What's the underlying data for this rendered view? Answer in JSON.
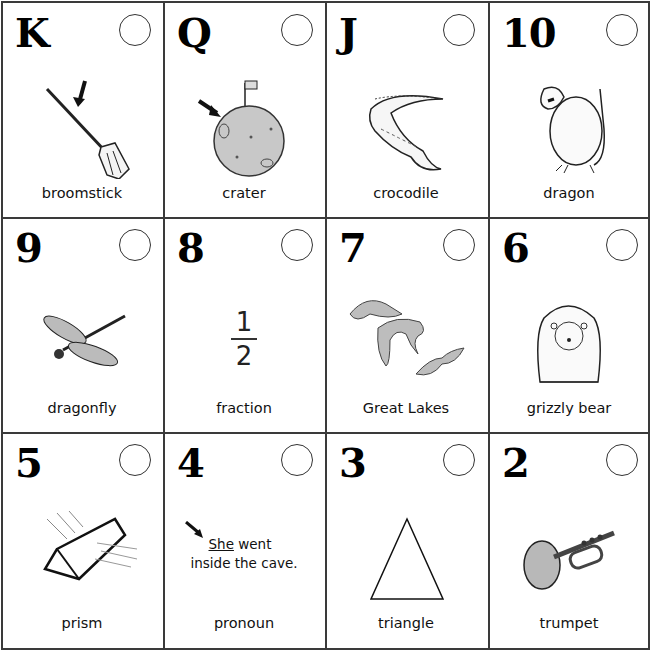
{
  "cards": [
    {
      "code": "K",
      "word": "broomstick",
      "picture": "broomstick-icon",
      "answer": ""
    },
    {
      "code": "Q",
      "word": "crater",
      "picture": "moon-crater-icon",
      "answer": ""
    },
    {
      "code": "J",
      "word": "crocodile",
      "picture": "crocodile-icon",
      "answer": ""
    },
    {
      "code": "10",
      "word": "dragon",
      "picture": "dragon-icon",
      "answer": ""
    },
    {
      "code": "9",
      "word": "dragonfly",
      "picture": "dragonfly-icon",
      "answer": ""
    },
    {
      "code": "8",
      "word": "fraction",
      "picture": "fraction",
      "answer": ""
    },
    {
      "code": "7",
      "word": "Great Lakes",
      "picture": "great-lakes-map-icon",
      "answer": ""
    },
    {
      "code": "6",
      "word": "grizzly bear",
      "picture": "grizzly-bear-icon",
      "answer": ""
    },
    {
      "code": "5",
      "word": "prism",
      "picture": "prism-icon",
      "answer": ""
    },
    {
      "code": "4",
      "word": "pronoun",
      "picture": "sentence",
      "answer": ""
    },
    {
      "code": "3",
      "word": "triangle",
      "picture": "triangle-icon",
      "answer": ""
    },
    {
      "code": "2",
      "word": "trumpet",
      "picture": "trumpet-icon",
      "answer": ""
    }
  ],
  "fraction": {
    "numerator": "1",
    "denominator": "2"
  },
  "sentence": {
    "pronoun": "She",
    "rest_line1": " went",
    "line2": "inside the cave."
  },
  "colors": {
    "border": "#3a3a3a",
    "fill_gray": "#bdbdbd",
    "text": "#111111"
  }
}
